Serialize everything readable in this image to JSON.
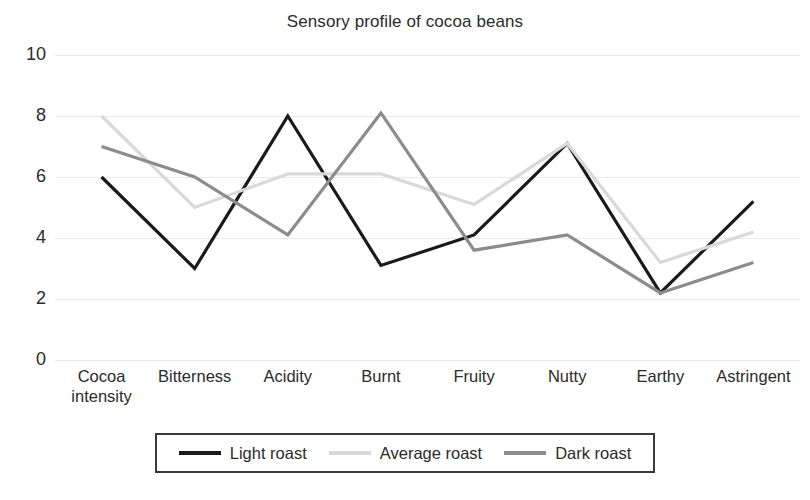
{
  "chart_data": {
    "type": "line",
    "title": "Sensory profile of cocoa beans",
    "xlabel": "",
    "ylabel": "",
    "ylim": [
      0,
      10
    ],
    "yticks": [
      0,
      2,
      4,
      6,
      8,
      10
    ],
    "grid": true,
    "legend_position": "bottom",
    "categories": [
      "Cocoa intensity",
      "Bitterness",
      "Acidity",
      "Burnt",
      "Fruity",
      "Nutty",
      "Earthy",
      "Astringent"
    ],
    "series": [
      {
        "name": "Light roast",
        "color": "#1a1a1a",
        "values": [
          6.0,
          3.0,
          8.0,
          3.1,
          4.1,
          7.1,
          2.2,
          5.2
        ]
      },
      {
        "name": "Average roast",
        "color": "#d9d9d9",
        "values": [
          8.0,
          5.0,
          6.1,
          6.1,
          5.1,
          7.1,
          3.2,
          4.2
        ]
      },
      {
        "name": "Dark roast",
        "color": "#8c8c8c",
        "values": [
          7.0,
          6.0,
          4.1,
          8.1,
          3.6,
          4.1,
          2.2,
          3.2
        ]
      }
    ]
  },
  "legend": {
    "items": [
      {
        "label": "Light roast",
        "color": "#1a1a1a"
      },
      {
        "label": "Average roast",
        "color": "#d9d9d9"
      },
      {
        "label": "Dark roast",
        "color": "#8c8c8c"
      }
    ]
  }
}
